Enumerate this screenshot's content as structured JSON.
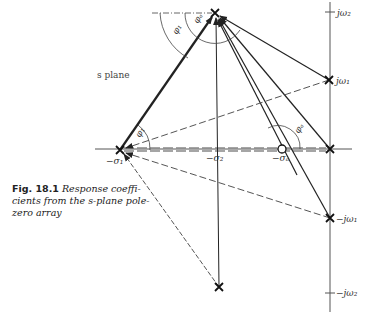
{
  "figure": {
    "number_label": "Fig. 18.1",
    "caption_line1": "Response coeffi-",
    "caption_line2": "cients from the s-plane pole-",
    "caption_line3": "zero array"
  },
  "plane_label": "s plane",
  "axis_labels": {
    "j_omega2": "jω₂",
    "j_omega1": "jω₁",
    "neg_j_omega1": "−jω₁",
    "neg_j_omega2": "−jω₂",
    "neg_sigma1": "−σ₁",
    "neg_sigma2": "−σ₂",
    "neg_sigma_a": "−σₐ"
  },
  "angle_labels": {
    "phi1_top": "φ₁",
    "phi_a_top": "φₐ",
    "phi1_left": "φ₁",
    "phi_a_right": "φₐ"
  },
  "points": {
    "pole_top": {
      "x": 215,
      "y": 13,
      "type": "pole"
    },
    "pole_bottom": {
      "x": 219,
      "y": 287,
      "type": "pole"
    },
    "pole_sigma1": {
      "x": 120,
      "y": 150,
      "type": "pole"
    },
    "pole_origin": {
      "x": 330,
      "y": 149,
      "type": "pole"
    },
    "pole_jw1": {
      "x": 329,
      "y": 80,
      "type": "pole"
    },
    "pole_neg_jw1": {
      "x": 330,
      "y": 218,
      "type": "pole"
    },
    "zero_sigma_a": {
      "x": 282,
      "y": 149,
      "type": "zero"
    }
  }
}
